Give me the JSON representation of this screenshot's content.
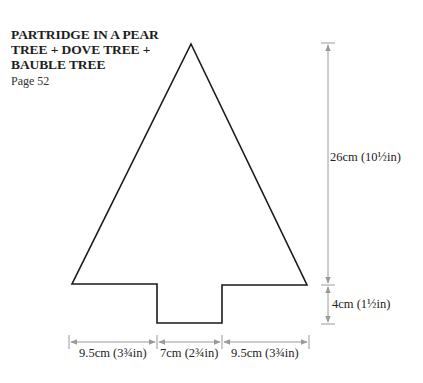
{
  "header": {
    "title_lines": [
      "PARTRIDGE IN A PEAR",
      "TREE + DOVE TREE +",
      "BAUBLE TREE"
    ],
    "page_ref": "Page 52"
  },
  "diagram": {
    "shape": "christmas-tree-template",
    "outline_color": "#1a1a1a",
    "dimension_color": "#9a9a9a",
    "dimensions": {
      "tree_height": "26cm (10½in)",
      "trunk_height": "4cm (1½in)",
      "left_width": "9.5cm (3¾in)",
      "trunk_width": "7cm (2¾in)",
      "right_width": "9.5cm (3¾in)"
    }
  }
}
